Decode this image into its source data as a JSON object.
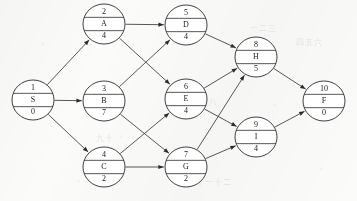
{
  "diagram": {
    "type": "directed-graph",
    "background_color": "#fbfbfa",
    "node_fill": "#ffffff",
    "stroke_color": "#2b2b2b",
    "node_shape": "ellipse",
    "node_row_layout": [
      "number",
      "activity",
      "duration"
    ],
    "ghost_marks": [
      {
        "text": "一二三",
        "x": 250,
        "y": 22
      },
      {
        "text": "四五六",
        "x": 296,
        "y": 36
      },
      {
        "text": "七八",
        "x": 200,
        "y": 96
      },
      {
        "text": "九十",
        "x": 96,
        "y": 132
      },
      {
        "text": "十一十二",
        "x": 196,
        "y": 176
      }
    ]
  },
  "nodes": [
    {
      "id": "n1",
      "number": "1",
      "activity": "S",
      "duration": "0",
      "cx": 33,
      "cy": 100,
      "rx": 21,
      "ry": 20
    },
    {
      "id": "n2",
      "number": "2",
      "activity": "A",
      "duration": "4",
      "cx": 104,
      "cy": 24,
      "rx": 21,
      "ry": 20
    },
    {
      "id": "n3",
      "number": "3",
      "activity": "B",
      "duration": "7",
      "cx": 104,
      "cy": 101,
      "rx": 21,
      "ry": 20
    },
    {
      "id": "n4",
      "number": "4",
      "activity": "C",
      "duration": "2",
      "cx": 104,
      "cy": 167,
      "rx": 21,
      "ry": 20
    },
    {
      "id": "n5",
      "number": "5",
      "activity": "D",
      "duration": "4",
      "cx": 186,
      "cy": 25,
      "rx": 21,
      "ry": 20
    },
    {
      "id": "n6",
      "number": "6",
      "activity": "E",
      "duration": "4",
      "cx": 186,
      "cy": 99,
      "rx": 21,
      "ry": 20
    },
    {
      "id": "n7",
      "number": "7",
      "activity": "G",
      "duration": "2",
      "cx": 186,
      "cy": 167,
      "rx": 21,
      "ry": 20
    },
    {
      "id": "n8",
      "number": "8",
      "activity": "H",
      "duration": "5",
      "cx": 256,
      "cy": 57,
      "rx": 21,
      "ry": 20
    },
    {
      "id": "n9",
      "number": "9",
      "activity": "I",
      "duration": "4",
      "cx": 256,
      "cy": 137,
      "rx": 21,
      "ry": 20
    },
    {
      "id": "n10",
      "number": "10",
      "activity": "F",
      "duration": "0",
      "cx": 324,
      "cy": 101,
      "rx": 21,
      "ry": 20
    }
  ],
  "edges": [
    {
      "id": "e1",
      "from": "n1",
      "to": "n2",
      "from_label": "S",
      "to_label": "A"
    },
    {
      "id": "e2",
      "from": "n1",
      "to": "n3",
      "from_label": "S",
      "to_label": "B"
    },
    {
      "id": "e3",
      "from": "n1",
      "to": "n4",
      "from_label": "S",
      "to_label": "C"
    },
    {
      "id": "e4",
      "from": "n2",
      "to": "n5",
      "from_label": "A",
      "to_label": "D"
    },
    {
      "id": "e5",
      "from": "n2",
      "to": "n6",
      "from_label": "A",
      "to_label": "E"
    },
    {
      "id": "e6",
      "from": "n3",
      "to": "n5",
      "from_label": "B",
      "to_label": "D"
    },
    {
      "id": "e7",
      "from": "n3",
      "to": "n7",
      "from_label": "B",
      "to_label": "G"
    },
    {
      "id": "e8",
      "from": "n4",
      "to": "n6",
      "from_label": "C",
      "to_label": "E"
    },
    {
      "id": "e9",
      "from": "n4",
      "to": "n7",
      "from_label": "C",
      "to_label": "G"
    },
    {
      "id": "e10",
      "from": "n5",
      "to": "n8",
      "from_label": "D",
      "to_label": "H"
    },
    {
      "id": "e11",
      "from": "n6",
      "to": "n8",
      "from_label": "E",
      "to_label": "H"
    },
    {
      "id": "e12",
      "from": "n6",
      "to": "n9",
      "from_label": "E",
      "to_label": "I"
    },
    {
      "id": "e13",
      "from": "n7",
      "to": "n8",
      "from_label": "G",
      "to_label": "H"
    },
    {
      "id": "e14",
      "from": "n7",
      "to": "n9",
      "from_label": "G",
      "to_label": "I"
    },
    {
      "id": "e15",
      "from": "n8",
      "to": "n10",
      "from_label": "H",
      "to_label": "F"
    },
    {
      "id": "e16",
      "from": "n9",
      "to": "n10",
      "from_label": "I",
      "to_label": "F"
    }
  ]
}
